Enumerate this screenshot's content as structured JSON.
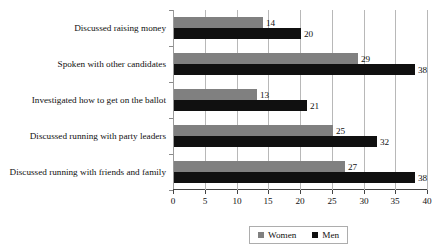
{
  "chart_data": {
    "type": "bar",
    "orientation": "horizontal",
    "title": "",
    "xlabel": "",
    "ylabel": "",
    "xlim": [
      0,
      40
    ],
    "xticks": [
      0,
      5,
      10,
      15,
      20,
      25,
      30,
      35,
      40
    ],
    "grid": true,
    "legend_position": "bottom",
    "categories": [
      "Discussed raising money",
      "Spoken with other candidates",
      "Investigated how to get on the ballot",
      "Discussed running with party leaders",
      "Discussed running with friends and family"
    ],
    "series": [
      {
        "name": "Women",
        "color": "#808080",
        "values": [
          14,
          29,
          13,
          25,
          27
        ]
      },
      {
        "name": "Men",
        "color": "#101010",
        "values": [
          20,
          38,
          21,
          32,
          38
        ]
      }
    ]
  },
  "legend": {
    "items": [
      {
        "label": "Women",
        "color": "#808080"
      },
      {
        "label": "Men",
        "color": "#101010"
      }
    ]
  },
  "colors": {
    "women": "#808080",
    "men": "#101010",
    "gridline": "#b8b8b8",
    "axis": "#444444",
    "text": "#111111",
    "background": "#ffffff"
  }
}
